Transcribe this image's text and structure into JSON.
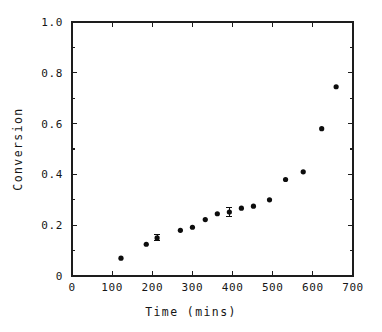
{
  "chart_data": {
    "type": "scatter",
    "title": "",
    "xlabel": "Time (mins)",
    "ylabel": "Conversion",
    "xlim": [
      0,
      700
    ],
    "ylim": [
      0,
      1.0
    ],
    "grid": false,
    "legend": null,
    "xticks": [
      0,
      100,
      200,
      300,
      400,
      500,
      600,
      700
    ],
    "xtick_labels": [
      "0",
      "100",
      "200",
      "300",
      "400",
      "500",
      "600",
      "700"
    ],
    "yticks": [
      0,
      0.2,
      0.4,
      0.6,
      0.8,
      1.0
    ],
    "ytick_labels": [
      "0",
      "0.2",
      "0.4",
      "0.6",
      "0.8",
      "1.0"
    ],
    "marker": "filled-circle",
    "marker_color": "#0d0d0d",
    "x": [
      122,
      185,
      212,
      270,
      300,
      332,
      362,
      392,
      422,
      452,
      492,
      532,
      576,
      622,
      658
    ],
    "y": [
      0.07,
      0.125,
      0.15,
      0.18,
      0.192,
      0.222,
      0.245,
      0.252,
      0.267,
      0.275,
      0.3,
      0.38,
      0.41,
      0.58,
      0.745
    ],
    "yerr": [
      0,
      0,
      0.012,
      0,
      0,
      0,
      0,
      0.018,
      0,
      0,
      0,
      0,
      0,
      0,
      0
    ],
    "points": [
      {
        "x": 122,
        "y": 0.07,
        "yerr": 0
      },
      {
        "x": 185,
        "y": 0.125,
        "yerr": 0
      },
      {
        "x": 212,
        "y": 0.15,
        "yerr": 0.012
      },
      {
        "x": 270,
        "y": 0.18,
        "yerr": 0
      },
      {
        "x": 300,
        "y": 0.192,
        "yerr": 0
      },
      {
        "x": 332,
        "y": 0.222,
        "yerr": 0
      },
      {
        "x": 362,
        "y": 0.245,
        "yerr": 0
      },
      {
        "x": 392,
        "y": 0.252,
        "yerr": 0.018
      },
      {
        "x": 422,
        "y": 0.267,
        "yerr": 0
      },
      {
        "x": 452,
        "y": 0.275,
        "yerr": 0
      },
      {
        "x": 492,
        "y": 0.3,
        "yerr": 0
      },
      {
        "x": 532,
        "y": 0.38,
        "yerr": 0
      },
      {
        "x": 576,
        "y": 0.41,
        "yerr": 0
      },
      {
        "x": 622,
        "y": 0.58,
        "yerr": 0
      },
      {
        "x": 658,
        "y": 0.745,
        "yerr": 0
      }
    ]
  }
}
